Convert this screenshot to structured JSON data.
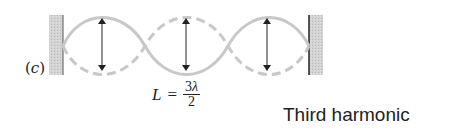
{
  "diagram": {
    "panel_label": {
      "open": "(",
      "var": "c",
      "close": ")"
    },
    "formula": {
      "lhs": "L",
      "equals": "=",
      "numerator": "3",
      "numerator_symbol": "λ",
      "denominator": "2"
    },
    "caption": "Third harmonic",
    "elements": {
      "walls": [
        "left-fixed-end",
        "right-fixed-end"
      ],
      "loops": 3,
      "amplitude_arrows": 3,
      "wave_styles": [
        "solid",
        "dashed"
      ]
    },
    "colors": {
      "wave": "#c8c8c8",
      "wall_fill": "#cfcfcf",
      "wall_edge": "#333333",
      "arrow": "#222222",
      "text": "#222222"
    }
  }
}
